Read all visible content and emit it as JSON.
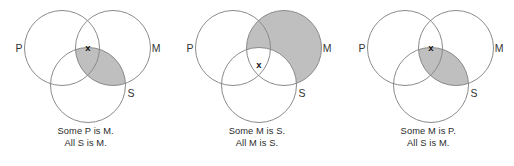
{
  "figure": {
    "type": "venn-diagram-set",
    "background_color": "#ffffff",
    "stroke_color": "#8a8a8a",
    "shade_color": "#bfbfbf",
    "text_color": "#2b2b2b",
    "x_marker": "x"
  },
  "panels": [
    {
      "id": "panel-1",
      "labels": {
        "p": "P",
        "m": "M",
        "s": "S"
      },
      "x_marker": "x",
      "x_region": "P-and-M-not-S",
      "shaded_region": "S-and-M",
      "caption": {
        "line1": "Some P is M.",
        "line2": "All S is M."
      }
    },
    {
      "id": "panel-2",
      "labels": {
        "p": "P",
        "m": "M",
        "s": "S"
      },
      "x_marker": "x",
      "x_region": "P-and-M-and-S",
      "shaded_region": "M-not-S",
      "caption": {
        "line1": "Some M is S.",
        "line2": "All M is S."
      }
    },
    {
      "id": "panel-3",
      "labels": {
        "p": "P",
        "m": "M",
        "s": "S"
      },
      "x_marker": "x",
      "x_region": "P-and-M-not-S",
      "shaded_region": "S-and-M",
      "caption": {
        "line1": "Some M is P.",
        "line2": "All S is M."
      }
    }
  ]
}
